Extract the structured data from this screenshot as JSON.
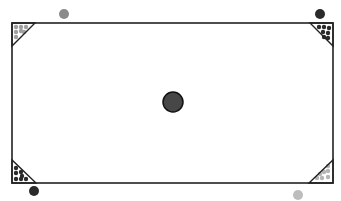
{
  "canvas": {
    "width": 341,
    "height": 201,
    "background": "#ffffff"
  },
  "board": {
    "x": 12,
    "y": 23,
    "width": 321,
    "height": 160,
    "fill": "#ffffff",
    "stroke": "#222222",
    "stroke_width": 1.6
  },
  "center_ball": {
    "cx": 173,
    "cy": 102,
    "r": 10,
    "fill": "#474747",
    "stroke": "#111111"
  },
  "corners": [
    {
      "id": "top-left",
      "triangle": [
        [
          12,
          23
        ],
        [
          35,
          23
        ],
        [
          12,
          46
        ]
      ],
      "dot_color": "#a0a0a0",
      "dots": [
        [
          16,
          27
        ],
        [
          21,
          27
        ],
        [
          26,
          27
        ],
        [
          16,
          32
        ],
        [
          21,
          31
        ],
        [
          16,
          37
        ],
        [
          24,
          32
        ]
      ]
    },
    {
      "id": "top-right",
      "triangle": [
        [
          310,
          23
        ],
        [
          333,
          23
        ],
        [
          333,
          46
        ]
      ],
      "dot_color": "#2a2a2a",
      "dots": [
        [
          319,
          27
        ],
        [
          324,
          27
        ],
        [
          329,
          28
        ],
        [
          323,
          32
        ],
        [
          328,
          33
        ],
        [
          328,
          38
        ],
        [
          324,
          37
        ]
      ]
    },
    {
      "id": "bottom-left",
      "triangle": [
        [
          12,
          160
        ],
        [
          12,
          183
        ],
        [
          36,
          183
        ]
      ],
      "dot_color": "#2a2a2a",
      "dots": [
        [
          16,
          168
        ],
        [
          16,
          173
        ],
        [
          21,
          172
        ],
        [
          16,
          179
        ],
        [
          21,
          179
        ],
        [
          26,
          179
        ],
        [
          22,
          176
        ]
      ]
    },
    {
      "id": "bottom-right",
      "triangle": [
        [
          333,
          160
        ],
        [
          333,
          183
        ],
        [
          309,
          183
        ]
      ],
      "dot_color": "#b5b5b5",
      "dots": [
        [
          328,
          166
        ],
        [
          328,
          171
        ],
        [
          324,
          172
        ],
        [
          328,
          177
        ],
        [
          322,
          178
        ],
        [
          317,
          178
        ],
        [
          320,
          174
        ]
      ]
    }
  ],
  "outer_balls": [
    {
      "id": "top-left-ball",
      "cx": 64,
      "cy": 14,
      "r": 5,
      "fill": "#8a8a8a"
    },
    {
      "id": "top-right-ball",
      "cx": 320,
      "cy": 14,
      "r": 5,
      "fill": "#2a2a2a"
    },
    {
      "id": "bottom-left-ball",
      "cx": 34,
      "cy": 191,
      "r": 5,
      "fill": "#2a2a2a"
    },
    {
      "id": "bottom-right-ball",
      "cx": 298,
      "cy": 195,
      "r": 5,
      "fill": "#bdbdbd"
    }
  ]
}
